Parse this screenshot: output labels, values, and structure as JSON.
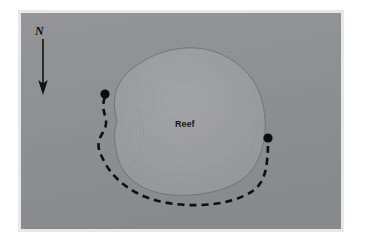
{
  "figure": {
    "type": "annotated-photograph-map",
    "caption_text": null,
    "background_color": "#ffffff",
    "photo": {
      "background_color": "#8f9092",
      "frame_color": "#e8e8e8",
      "width_px": 320,
      "height_px": 216
    },
    "labels": {
      "north_indicator": "N",
      "reef_label": "Reef"
    },
    "annotations": {
      "north_arrow": {
        "name": "north-arrow",
        "direction": "down",
        "color": "#111111",
        "shaft_from": [
          40,
          38
        ],
        "shaft_to": [
          40,
          86
        ]
      },
      "track_line": {
        "name": "dashed-survey-track",
        "style": "dashed",
        "color": "#101010",
        "width_px": 3,
        "dash_pattern": "7 5"
      },
      "endpoint_markers": [
        {
          "name": "start-point-marker",
          "x": 114,
          "y": 106,
          "radius": 5,
          "color": "#0d0d0d"
        },
        {
          "name": "end-point-marker",
          "x": 269,
          "y": 154,
          "radius": 5,
          "color": "#0d0d0d"
        }
      ],
      "reef_outline": {
        "name": "reef-boundary-outline",
        "stroke_color": "#6f7072",
        "fill_color": "#9a9b9d",
        "stroke_width_px": 1
      }
    }
  }
}
